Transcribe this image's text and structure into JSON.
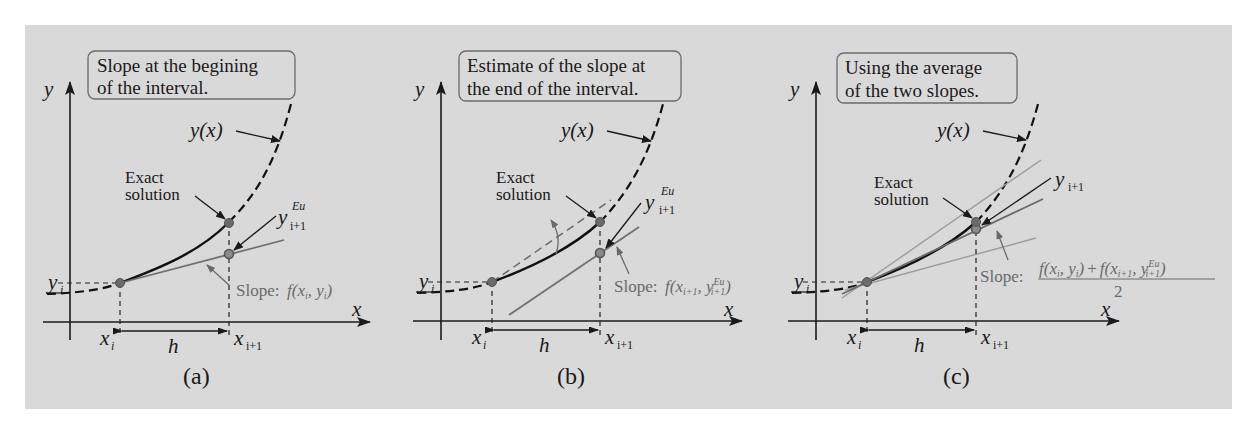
{
  "figure": {
    "background_color": "#d9d9d9",
    "panels": [
      {
        "id": "a",
        "title_line1": "Slope at the begining",
        "title_line2": "of the interval.",
        "y_axis_label": "y",
        "x_axis_label": "x",
        "curve_label": "y(x)",
        "exact_label_line1": "Exact",
        "exact_label_line2": "solution",
        "estimate_label_main": "y",
        "estimate_label_sup": "Eu",
        "estimate_label_sub": "i+1",
        "yi_label_main": "y",
        "yi_label_sub": "i",
        "xi_label_main": "x",
        "xi_label_sub": "i",
        "xi1_label_main": "x",
        "xi1_label_sub": "i+1",
        "h_label": "h",
        "slope_prefix": "Slope:",
        "slope_expr": "f(x",
        "slope_expr_sub1": "i",
        "slope_expr_mid": ", y",
        "slope_expr_sub2": "i",
        "slope_expr_end": ")",
        "caption": "(a)"
      },
      {
        "id": "b",
        "title_line1": "Estimate of the slope at",
        "title_line2": "the end of the interval.",
        "y_axis_label": "y",
        "x_axis_label": "x",
        "curve_label": "y(x)",
        "exact_label_line1": "Exact",
        "exact_label_line2": "solution",
        "estimate_label_main": "y",
        "estimate_label_sup": "Eu",
        "estimate_label_sub": "i+1",
        "yi_label_main": "y",
        "yi_label_sub": "i",
        "xi_label_main": "x",
        "xi_label_sub": "i",
        "xi1_label_main": "x",
        "xi1_label_sub": "i+1",
        "h_label": "h",
        "slope_prefix": "Slope:",
        "slope_expr": "f(x",
        "slope_expr_sub1": "i+1",
        "slope_expr_mid": ", y",
        "slope_expr_sup2": "Eu",
        "slope_expr_sub2": "i+1",
        "slope_expr_end": ")",
        "caption": "(b)"
      },
      {
        "id": "c",
        "title_line1": "Using the average",
        "title_line2": "of the two slopes.",
        "y_axis_label": "y",
        "x_axis_label": "x",
        "curve_label": "y(x)",
        "exact_label_line1": "Exact",
        "exact_label_line2": "solution",
        "estimate_label_main": "y",
        "estimate_label_sub": "i+1",
        "yi_label_main": "y",
        "yi_label_sub": "i",
        "xi_label_main": "x",
        "xi_label_sub": "i",
        "xi1_label_main": "x",
        "xi1_label_sub": "i+1",
        "h_label": "h",
        "slope_prefix": "Slope:",
        "slope_num_a": "f(x",
        "slope_num_a_sub1": "i",
        "slope_num_a_mid": ", y",
        "slope_num_a_sub2": "i",
        "slope_num_a_end": ")",
        "slope_num_plus": "+",
        "slope_num_b": "f(x",
        "slope_num_b_sub1": "i+1",
        "slope_num_b_mid": ", y",
        "slope_num_b_sup2": "Eu",
        "slope_num_b_sub2": "i+1",
        "slope_num_b_end": ")",
        "slope_denominator": "2",
        "caption": "(c)"
      }
    ]
  }
}
